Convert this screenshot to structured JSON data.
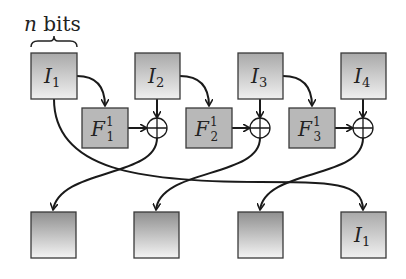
{
  "header": {
    "brace_var": "n",
    "brace_text": " bits"
  },
  "top_blocks": [
    {
      "name": "I",
      "sub": "1"
    },
    {
      "name": "I",
      "sub": "2"
    },
    {
      "name": "I",
      "sub": "3"
    },
    {
      "name": "I",
      "sub": "4"
    }
  ],
  "round_functions": [
    {
      "name": "F",
      "sub": "1",
      "sup": "1"
    },
    {
      "name": "F",
      "sub": "2",
      "sup": "1"
    },
    {
      "name": "F",
      "sub": "3",
      "sup": "1"
    }
  ],
  "xor_symbol": "⊕",
  "bottom_blocks": [
    {
      "label": ""
    },
    {
      "label": ""
    },
    {
      "label": ""
    },
    {
      "name": "I",
      "sub": "1"
    }
  ],
  "colors": {
    "box_fill_light": "#f2f2f2",
    "box_fill_dark": "#9a9a9a",
    "stroke": "#3a3a3a",
    "arrow": "#1a1a1a"
  }
}
